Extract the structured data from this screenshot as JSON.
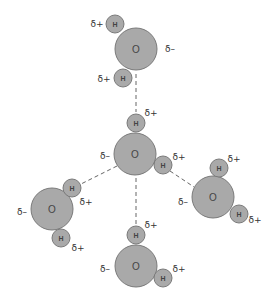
{
  "diagram": {
    "type": "water-hydrogen-bonding",
    "colors": {
      "atom_fill": "#a9a9a9",
      "atom_stroke": "#7a7a7a",
      "bond": "#666666",
      "text": "#333333"
    },
    "molecules": [
      {
        "id": "top",
        "oxygen": {
          "label": "O",
          "x": 136,
          "y": 49,
          "r": 21,
          "charge": "δ–",
          "charge_x": 170,
          "charge_y": 49
        },
        "hydrogens": [
          {
            "label": "H",
            "x": 115,
            "y": 24,
            "r": 9,
            "charge": "δ+",
            "charge_x": 97,
            "charge_y": 24
          },
          {
            "label": "H",
            "x": 123,
            "y": 78,
            "r": 9,
            "charge": "δ+",
            "charge_x": 104,
            "charge_y": 79
          }
        ]
      },
      {
        "id": "center",
        "oxygen": {
          "label": "O",
          "x": 135,
          "y": 154,
          "r": 21,
          "charge": "δ–",
          "charge_x": 105,
          "charge_y": 156
        },
        "hydrogens": [
          {
            "label": "H",
            "x": 136,
            "y": 123,
            "r": 9,
            "charge": "δ+",
            "charge_x": 151,
            "charge_y": 113
          },
          {
            "label": "H",
            "x": 163,
            "y": 165,
            "r": 9,
            "charge": "δ+",
            "charge_x": 179,
            "charge_y": 157
          }
        ]
      },
      {
        "id": "left",
        "oxygen": {
          "label": "O",
          "x": 52,
          "y": 209,
          "r": 21,
          "charge": "δ–",
          "charge_x": 22,
          "charge_y": 212
        },
        "hydrogens": [
          {
            "label": "H",
            "x": 72,
            "y": 188,
            "r": 9,
            "charge": "δ+",
            "charge_x": 86,
            "charge_y": 202
          },
          {
            "label": "H",
            "x": 61,
            "y": 238,
            "r": 9,
            "charge": "δ+",
            "charge_x": 78,
            "charge_y": 248
          }
        ]
      },
      {
        "id": "right",
        "oxygen": {
          "label": "O",
          "x": 213,
          "y": 197,
          "r": 21,
          "charge": "δ–",
          "charge_x": 183,
          "charge_y": 202
        },
        "hydrogens": [
          {
            "label": "H",
            "x": 219,
            "y": 168,
            "r": 9,
            "charge": "δ+",
            "charge_x": 234,
            "charge_y": 159
          },
          {
            "label": "H",
            "x": 239,
            "y": 214,
            "r": 9,
            "charge": "δ+",
            "charge_x": 255,
            "charge_y": 220
          }
        ]
      },
      {
        "id": "bottom",
        "oxygen": {
          "label": "O",
          "x": 136,
          "y": 266,
          "r": 21,
          "charge": "δ–",
          "charge_x": 105,
          "charge_y": 269
        },
        "hydrogens": [
          {
            "label": "H",
            "x": 136,
            "y": 235,
            "r": 9,
            "charge": "δ+",
            "charge_x": 151,
            "charge_y": 225
          },
          {
            "label": "H",
            "x": 163,
            "y": 278,
            "r": 9,
            "charge": "δ+",
            "charge_x": 179,
            "charge_y": 269
          }
        ]
      }
    ],
    "hydrogen_bonds": [
      {
        "from": "top.O",
        "to": "center.H",
        "x1": 136,
        "y1": 74,
        "x2": 136,
        "y2": 112
      },
      {
        "from": "center.O",
        "to": "left.H",
        "x1": 117,
        "y1": 166,
        "x2": 81,
        "y2": 184
      },
      {
        "from": "center.O",
        "to": "bottom.H",
        "x1": 136,
        "y1": 178,
        "x2": 136,
        "y2": 225
      },
      {
        "from": "center.H",
        "to": "right.O",
        "x1": 170,
        "y1": 171,
        "x2": 194,
        "y2": 187
      }
    ]
  }
}
